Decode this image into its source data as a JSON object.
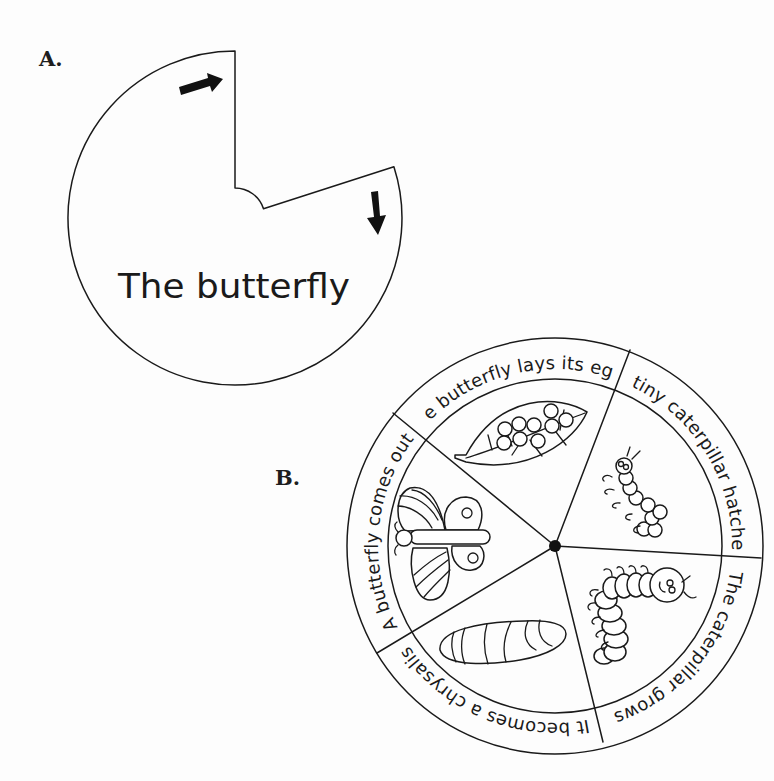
{
  "labels": {
    "part_a": "A.",
    "part_b": "B."
  },
  "cover_wheel": {
    "title": "The butterfly",
    "arrows": [
      "arrow-right-icon",
      "arrow-down-icon"
    ],
    "stroke_color": "#1a1a1a"
  },
  "life_cycle_wheel": {
    "stages": [
      {
        "label": "The butterfly lays its eggs",
        "illustration": "leaf-with-eggs"
      },
      {
        "label": "A tiny caterpillar hatches",
        "illustration": "tiny-caterpillar"
      },
      {
        "label": "The caterpillar grows",
        "illustration": "big-caterpillar"
      },
      {
        "label": "It becomes a chrysalis",
        "illustration": "chrysalis"
      },
      {
        "label": "A butterfly comes out",
        "illustration": "butterfly"
      }
    ],
    "center_pin": "pivot-dot"
  }
}
